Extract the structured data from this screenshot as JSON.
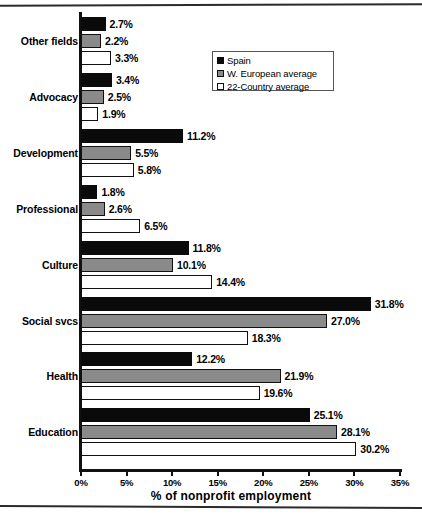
{
  "chart_data": {
    "type": "bar",
    "orientation": "horizontal",
    "title": "",
    "xlabel": "% of nonprofit employment",
    "ylabel": "",
    "xlim": [
      0,
      35
    ],
    "xticks": [
      "0%",
      "5%",
      "10%",
      "15%",
      "20%",
      "25%",
      "30%",
      "35%"
    ],
    "xtick_values": [
      0,
      5,
      10,
      15,
      20,
      25,
      30,
      35
    ],
    "grid": false,
    "legend_position": "upper-right-inside",
    "categories": [
      "Other fields",
      "Advocacy",
      "Development",
      "Professional",
      "Culture",
      "Social svcs",
      "Health",
      "Education"
    ],
    "series": [
      {
        "name": "Spain",
        "color": "#0a0a0a",
        "values": [
          2.7,
          3.4,
          11.2,
          1.8,
          11.8,
          31.8,
          12.2,
          25.1
        ],
        "labels": [
          "2.7%",
          "3.4%",
          "11.2%",
          "1.8%",
          "11.8%",
          "31.8%",
          "12.2%",
          "25.1%"
        ]
      },
      {
        "name": "W. European average",
        "color": "#8a8a8a",
        "values": [
          2.2,
          2.5,
          5.5,
          2.6,
          10.1,
          27.0,
          21.9,
          28.1
        ],
        "labels": [
          "2.2%",
          "2.5%",
          "5.5%",
          "2.6%",
          "10.1%",
          "27.0%",
          "21.9%",
          "28.1%"
        ]
      },
      {
        "name": "22-Country average",
        "color": "#ffffff",
        "values": [
          3.3,
          1.9,
          5.8,
          6.5,
          14.4,
          18.3,
          19.6,
          30.2
        ],
        "labels": [
          "3.3%",
          "1.9%",
          "5.8%",
          "6.5%",
          "14.4%",
          "18.3%",
          "19.6%",
          "30.2%"
        ]
      }
    ]
  }
}
